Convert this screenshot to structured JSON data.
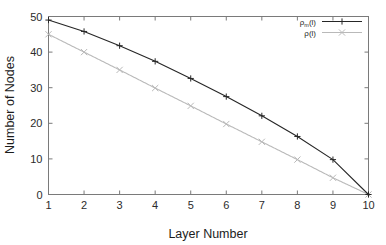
{
  "chart_data": {
    "type": "line",
    "title": "",
    "xlabel": "Layer Number",
    "ylabel": "Number of Nodes",
    "x": [
      1,
      2,
      3,
      4,
      5,
      6,
      7,
      8,
      9,
      10
    ],
    "xlim": [
      1,
      10
    ],
    "ylim": [
      0,
      50
    ],
    "xticks": [
      "1",
      "2",
      "3",
      "4",
      "5",
      "6",
      "7",
      "8",
      "9",
      "10"
    ],
    "yticks": [
      "0",
      "10",
      "20",
      "30",
      "40",
      "50"
    ],
    "grid": false,
    "legend_position": "top-right",
    "series": [
      {
        "name": "rho_m(l)",
        "label_base": "ρ",
        "label_sub": "m",
        "label_tail": "(l)",
        "color": "#262626",
        "marker": "plus",
        "linestyle": "solid",
        "values": [
          49.0,
          45.8,
          41.8,
          37.4,
          32.6,
          27.5,
          22.1,
          16.3,
          9.8,
          0.0
        ]
      },
      {
        "name": "rho(l)",
        "label_base": "ρ",
        "label_sub": "",
        "label_tail": "(l)",
        "color": "#b9b9b9",
        "marker": "cross",
        "linestyle": "dotted",
        "values": [
          45.0,
          40.0,
          35.0,
          29.9,
          24.9,
          19.8,
          14.8,
          9.8,
          4.7,
          0.0
        ]
      }
    ]
  },
  "axes": {
    "x_title": "Layer Number",
    "y_title": "Number of Nodes"
  },
  "legend": {
    "entries": [
      {
        "text": "ρ",
        "sub": "m",
        "tail": "(l)"
      },
      {
        "text": "ρ",
        "sub": "",
        "tail": "(l)"
      }
    ]
  },
  "colors": {
    "series_main": "#262626",
    "series_alt": "#b9b9b9",
    "axis": "#7a7a7a",
    "text": "#1c1c1c",
    "background": "#ffffff"
  }
}
